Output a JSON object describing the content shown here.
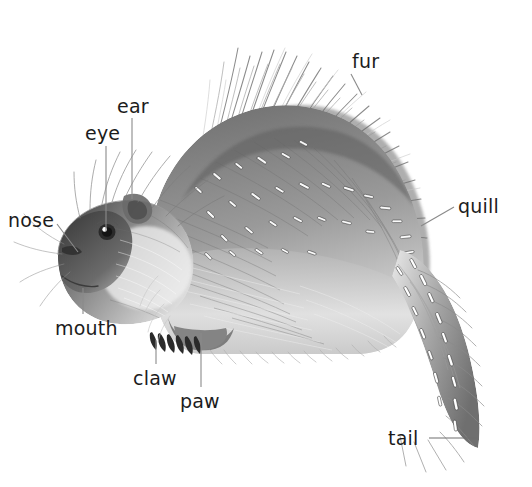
{
  "diagram": {
    "style": "grayscale pencil illustration",
    "background_color": "#ffffff",
    "label_color": "#1c1c1c",
    "leader_line_color": "#8a8a8a",
    "width": 532,
    "height": 487
  },
  "labels": [
    {
      "id": "fur",
      "text": "fur",
      "x": 352,
      "y": 52,
      "leader": {
        "x1": 351,
        "y1": 74,
        "x2": 362,
        "y2": 95
      }
    },
    {
      "id": "ear",
      "text": "ear",
      "x": 117,
      "y": 97,
      "leader": {
        "x1": 132,
        "y1": 118,
        "x2": 132,
        "y2": 199
      }
    },
    {
      "id": "eye",
      "text": "eye",
      "x": 85,
      "y": 124,
      "leader": {
        "x1": 106,
        "y1": 146,
        "x2": 106,
        "y2": 231
      }
    },
    {
      "id": "nose",
      "text": "nose",
      "x": 8,
      "y": 211,
      "leader": {
        "x1": 57,
        "y1": 224,
        "x2": 78,
        "y2": 252
      }
    },
    {
      "id": "quill",
      "text": "quill",
      "x": 458,
      "y": 197,
      "leader": {
        "x1": 454,
        "y1": 207,
        "x2": 421,
        "y2": 226
      }
    },
    {
      "id": "mouth",
      "text": "mouth",
      "x": 55,
      "y": 319,
      "leader": {
        "x1": 83,
        "y1": 288,
        "x2": 83,
        "y2": 314
      }
    },
    {
      "id": "claw",
      "text": "claw",
      "x": 133,
      "y": 369,
      "leader": {
        "x1": 156,
        "y1": 340,
        "x2": 156,
        "y2": 364
      }
    },
    {
      "id": "paw",
      "text": "paw",
      "x": 180,
      "y": 392,
      "leader": {
        "x1": 201,
        "y1": 333,
        "x2": 201,
        "y2": 387
      }
    },
    {
      "id": "tail",
      "text": "tail",
      "x": 388,
      "y": 429,
      "leader": {
        "x1": 429,
        "y1": 438,
        "x2": 477,
        "y2": 438
      }
    }
  ]
}
